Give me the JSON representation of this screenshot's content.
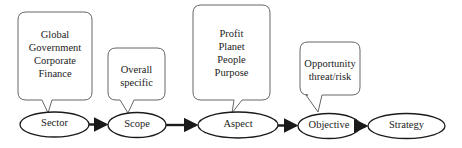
{
  "diagram": {
    "nodes": [
      {
        "id": "sector",
        "label": "Sector"
      },
      {
        "id": "scope",
        "label": "Scope"
      },
      {
        "id": "aspect",
        "label": "Aspect"
      },
      {
        "id": "objective",
        "label": "Objective"
      },
      {
        "id": "strategy",
        "label": "Strategy"
      }
    ],
    "callouts": [
      {
        "for": "sector",
        "lines": [
          "Global",
          "Government",
          "Corporate",
          "Finance"
        ]
      },
      {
        "for": "scope",
        "lines": [
          "Overall",
          "specific"
        ]
      },
      {
        "for": "aspect",
        "lines": [
          "Profit",
          "Planet",
          "People",
          "Purpose"
        ]
      },
      {
        "for": "objective",
        "lines": [
          "Opportunity",
          "threat/risk"
        ]
      }
    ],
    "edges": [
      {
        "from": "sector",
        "to": "scope"
      },
      {
        "from": "scope",
        "to": "aspect"
      },
      {
        "from": "aspect",
        "to": "objective"
      },
      {
        "from": "objective",
        "to": "strategy"
      }
    ],
    "colors": {
      "stroke": "#1a1a1a",
      "callout_stroke": "#555555",
      "background": "#ffffff"
    }
  }
}
